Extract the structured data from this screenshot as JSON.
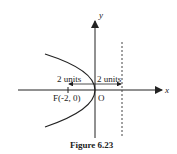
{
  "figure": {
    "caption": "Figure 6.23",
    "axis_x_label": "x",
    "axis_y_label": "y",
    "origin_label": "O",
    "focus_label": "F(-2, 0)",
    "left_distance_label": "2 units",
    "right_distance_label": "2 units",
    "curve": "parabola y^2 = -8x opening left",
    "directrix": "x = 2 (dotted)"
  }
}
